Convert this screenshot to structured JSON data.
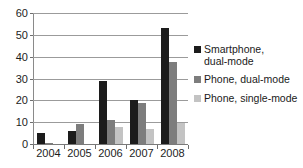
{
  "chart_data": {
    "type": "bar",
    "title": "",
    "subtitle": "",
    "xlabel": "",
    "ylabel": "",
    "categories": [
      "2004",
      "2005",
      "2006",
      "2007",
      "2008"
    ],
    "ylim": [
      0,
      60
    ],
    "yticks": [
      0,
      10,
      20,
      30,
      40,
      50,
      60
    ],
    "ytick_labels": [
      "0",
      "10",
      "20",
      "30",
      "40",
      "50",
      "60"
    ],
    "grid": true,
    "grid_axis": "y",
    "legend_position": "right",
    "series": [
      {
        "name": "Smartphone, dual-mode",
        "legend_label": "Smartphone,\ndual-mode",
        "color": "#1c1c1c",
        "values": [
          5,
          6,
          29,
          20,
          53
        ]
      },
      {
        "name": "Phone, dual-mode",
        "legend_label": "Phone, dual-mode",
        "color": "#7d7d7d",
        "values": [
          0.5,
          9,
          11,
          19,
          37.5
        ]
      },
      {
        "name": "Phone, single-mode",
        "legend_label": "Phone, single-mode",
        "color": "#c3c3c3",
        "values": [
          0,
          0,
          8,
          7,
          9.5
        ]
      }
    ]
  }
}
